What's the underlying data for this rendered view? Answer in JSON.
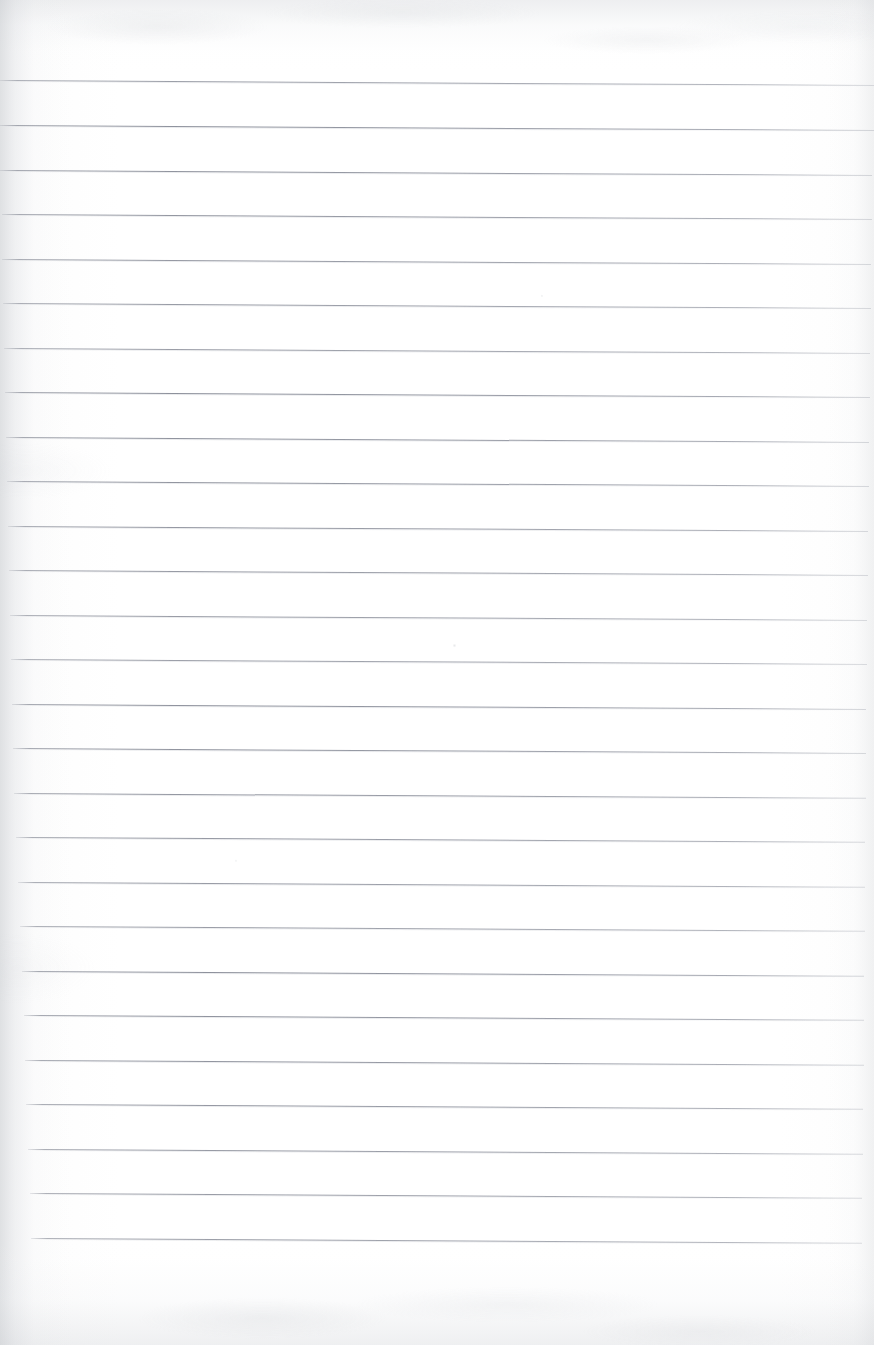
{
  "document": {
    "type": "scanned-ruled-notebook-page",
    "title": "Blank Lined Paper Scan",
    "content_text": "",
    "page_width": 874,
    "page_height": 1345,
    "paper_color": "#fefefe",
    "rule_color": "#888c98",
    "rule_count": 26,
    "rule_spacing_px": 45,
    "first_rule_y": 80,
    "last_rule_y": 1238,
    "rule_slope_px": 5,
    "top_margin_px": 80,
    "bottom_margin_px": 107,
    "has_handwriting": false,
    "has_header_text": false,
    "has_page_number": false,
    "rules": [
      {
        "y": 80,
        "left": 0,
        "right": 874
      },
      {
        "y": 125,
        "left": 0,
        "right": 874
      },
      {
        "y": 170,
        "left": 0,
        "right": 872
      },
      {
        "y": 214,
        "left": 2,
        "right": 872
      },
      {
        "y": 259,
        "left": 2,
        "right": 871
      },
      {
        "y": 303,
        "left": 3,
        "right": 871
      },
      {
        "y": 348,
        "left": 4,
        "right": 870
      },
      {
        "y": 392,
        "left": 5,
        "right": 870
      },
      {
        "y": 437,
        "left": 6,
        "right": 869
      },
      {
        "y": 481,
        "left": 7,
        "right": 869
      },
      {
        "y": 526,
        "left": 8,
        "right": 868
      },
      {
        "y": 570,
        "left": 9,
        "right": 868
      },
      {
        "y": 615,
        "left": 10,
        "right": 867
      },
      {
        "y": 659,
        "left": 11,
        "right": 867
      },
      {
        "y": 704,
        "left": 12,
        "right": 866
      },
      {
        "y": 748,
        "left": 13,
        "right": 866
      },
      {
        "y": 793,
        "left": 14,
        "right": 866
      },
      {
        "y": 837,
        "left": 16,
        "right": 865
      },
      {
        "y": 882,
        "left": 18,
        "right": 865
      },
      {
        "y": 926,
        "left": 20,
        "right": 865
      },
      {
        "y": 971,
        "left": 22,
        "right": 864
      },
      {
        "y": 1015,
        "left": 24,
        "right": 864
      },
      {
        "y": 1060,
        "left": 25,
        "right": 864
      },
      {
        "y": 1104,
        "left": 26,
        "right": 863
      },
      {
        "y": 1149,
        "left": 28,
        "right": 863
      },
      {
        "y": 1193,
        "left": 30,
        "right": 862
      },
      {
        "y": 1238,
        "left": 31,
        "right": 862
      }
    ]
  }
}
